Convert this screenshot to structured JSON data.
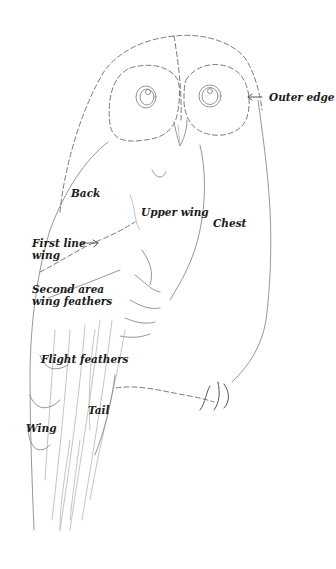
{
  "diagram": {
    "labels": {
      "outer_edge": "Outer edge",
      "back": "Back",
      "upper_wing": "Upper wing",
      "chest": "Chest",
      "first_line_wing_1": "First line",
      "first_line_wing_2": "wing",
      "second_area_1": "Second area",
      "second_area_2": "wing feathers",
      "flight_feathers": "Flight feathers",
      "tail": "Tail",
      "wing": "Wing"
    },
    "colors": {
      "line": "#8a8a8a",
      "label": "#1a1a1a",
      "background": "#ffffff"
    }
  }
}
